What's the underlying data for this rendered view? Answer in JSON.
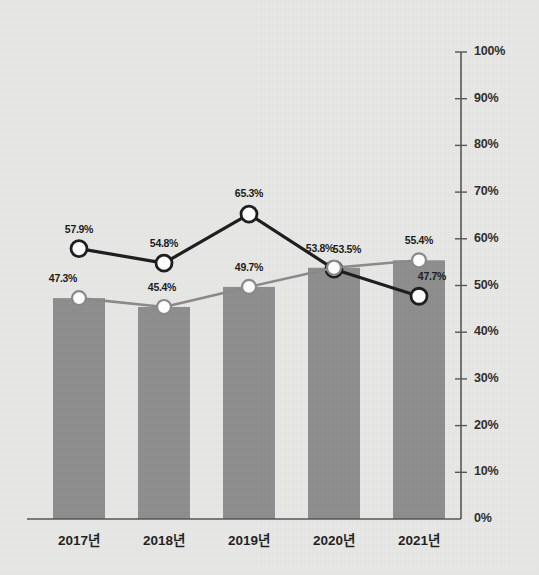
{
  "chart_data": {
    "type": "bar",
    "title": "",
    "subtitle": "",
    "xlabel": "",
    "ylabel": "",
    "categories": [
      "2017년",
      "2018년",
      "2019년",
      "2020년",
      "2021년"
    ],
    "ylim": [
      0,
      100
    ],
    "ytick_labels": [
      "0%",
      "10%",
      "20%",
      "30%",
      "40%",
      "50%",
      "60%",
      "70%",
      "80%",
      "90%",
      "100%"
    ],
    "ytick_values": [
      0,
      10,
      20,
      30,
      40,
      50,
      60,
      70,
      80,
      90,
      100
    ],
    "grid": false,
    "legend_position": "none",
    "series": [
      {
        "name": "bars",
        "type": "bar",
        "values": [
          47.3,
          45.4,
          49.7,
          53.8,
          55.4
        ],
        "color": "#8e8e8e",
        "labels": []
      },
      {
        "name": "dark-line",
        "type": "line",
        "values": [
          57.9,
          54.8,
          65.3,
          53.5,
          47.7
        ],
        "color": "#1c1c1c",
        "marker_fill": "#ffffff",
        "labels": [
          "57.9%",
          "54.8%",
          "65.3%",
          "53.5%",
          "47.7%"
        ]
      },
      {
        "name": "gray-line",
        "type": "line",
        "values": [
          47.3,
          45.4,
          49.7,
          53.8,
          55.4
        ],
        "color": "#8a8a8a",
        "marker_fill": "#ffffff",
        "labels": [
          "47.3%",
          "45.4%",
          "49.7%",
          "53.8%",
          "55.4%"
        ]
      }
    ],
    "axis_color": "#555555",
    "background_color": "#e8e8e6"
  }
}
